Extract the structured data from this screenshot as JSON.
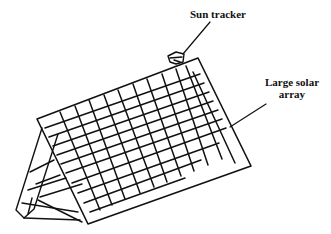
{
  "figure": {
    "labels": {
      "sun_tracker": "Sun tracker",
      "solar_array": "Large solar array"
    },
    "colors": {
      "line": "#111111",
      "background": "#ffffff"
    },
    "grid": {
      "rows": 8,
      "columns": 11
    }
  }
}
